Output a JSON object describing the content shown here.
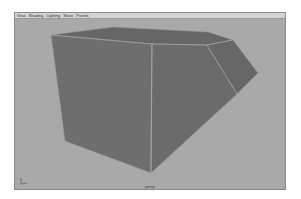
{
  "viewport": {
    "menu": [
      {
        "label": "View"
      },
      {
        "label": "Shading"
      },
      {
        "label": "Lighting"
      },
      {
        "label": "Show"
      },
      {
        "label": "Panels"
      }
    ],
    "camera_label": "persp",
    "colors": {
      "background": "#a9a9a9",
      "menu_bar": "#d4d4d4",
      "mesh_face": "#6e6e6e",
      "mesh_edge": "#9c9c9c"
    }
  },
  "icons": {
    "axis_gizmo": "axis-gizmo-icon"
  }
}
